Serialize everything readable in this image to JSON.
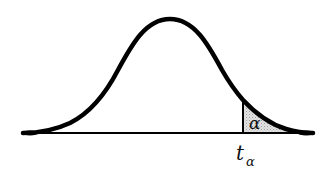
{
  "diagram": {
    "type": "probability-distribution",
    "curve": {
      "shape": "bell",
      "peak_x": 170,
      "peak_y": 19,
      "baseline_y": 133,
      "left_end_x": 23,
      "right_end_x": 313,
      "stroke_color": "#000000"
    },
    "critical_line": {
      "x": 243,
      "label_main": "t",
      "label_subscript": "α"
    },
    "shaded_region": {
      "side": "right-tail",
      "label": "α",
      "fill_color": "#d6d6d6"
    }
  }
}
